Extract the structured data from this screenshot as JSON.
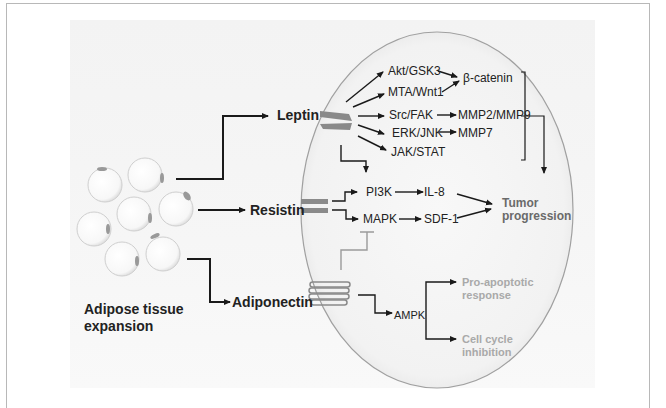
{
  "diagram": {
    "source": {
      "label_line1": "Adipose tissue",
      "label_line2": "expansion"
    },
    "adipokines": {
      "leptin": "Leptin",
      "resistin": "Resistin",
      "adiponectin": "Adiponectin"
    },
    "leptin_pathways": {
      "akt_gsk3": "Akt/GSK3",
      "mta_wnt1": "MTA/Wnt1",
      "src_fak": "Src/FAK",
      "erk_jnk": "ERK/JNK",
      "jak_stat": "JAK/STAT"
    },
    "leptin_targets": {
      "beta_catenin": "β-catenin",
      "mmp2_mmp9": "MMP2/MMP9",
      "mmp7": "MMP7"
    },
    "resistin_pathways": {
      "pi3k": "PI3K",
      "mapk": "MAPK",
      "il8": "IL-8",
      "sdf1": "SDF-1"
    },
    "outcome": {
      "line1": "Tumor",
      "line2": "progression"
    },
    "adiponectin_pathway": {
      "ampk": "AMPK",
      "pro_apoptotic_line1": "Pro-apoptotic",
      "pro_apoptotic_line2": "response",
      "cell_cycle_line1": "Cell cycle",
      "cell_cycle_line2": "inhibition"
    },
    "colors": {
      "arrow": "#1a1a1a",
      "receptor": "#8a8a8a",
      "inhibition_line": "#9a9a9a",
      "cell_membrane": "#a0a0a0",
      "muted_text": "#a9a9a9",
      "tumor_text": "#6a6a6a"
    }
  }
}
